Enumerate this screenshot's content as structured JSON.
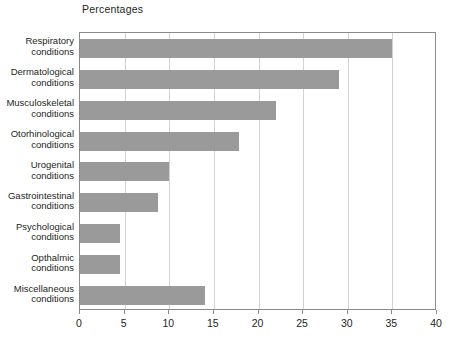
{
  "chart_data": {
    "type": "bar",
    "orientation": "horizontal",
    "title": "Percentages",
    "xlabel": "",
    "ylabel": "",
    "xlim": [
      0,
      40
    ],
    "xticks": [
      0,
      5,
      10,
      15,
      20,
      25,
      30,
      35,
      40
    ],
    "grid": true,
    "legend": null,
    "bar_color": "#9a9a9a",
    "categories": [
      "Respiratory conditions",
      "Dermatological conditions",
      "Musculoskeletal conditions",
      "Otorhinological conditions",
      "Urogenital conditions",
      "Gastrointestinal conditions",
      "Psychological conditions",
      "Opthalmic conditions",
      "Miscellaneous conditions"
    ],
    "category_lines": [
      [
        "Respiratory",
        "conditions"
      ],
      [
        "Dermatological",
        "conditions"
      ],
      [
        "Musculoskeletal",
        "conditions"
      ],
      [
        "Otorhinological",
        "conditions"
      ],
      [
        "Urogenital",
        "conditions"
      ],
      [
        "Gastrointestinal",
        "conditions"
      ],
      [
        "Psychological",
        "conditions"
      ],
      [
        "Opthalmic",
        "conditions"
      ],
      [
        "Miscellaneous",
        "conditions"
      ]
    ],
    "values": [
      35,
      29,
      22,
      17.8,
      10,
      8.7,
      4.5,
      4.5,
      14
    ]
  }
}
